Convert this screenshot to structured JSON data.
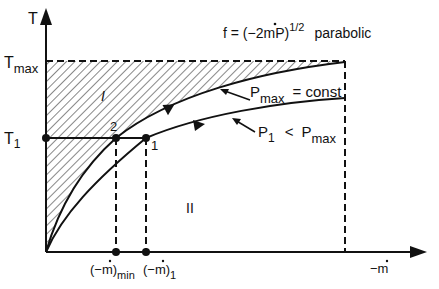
{
  "diagram": {
    "y_axis_label": "T",
    "x_axis_label": "−m",
    "x_axis_dot": "·",
    "t_max_label": "T",
    "t_max_sub": "max",
    "t1_label": "T",
    "t1_sub": "1",
    "formula": {
      "prefix": "f = (−2",
      "m": "m",
      "suffix": "P)",
      "exponent": "1/2",
      "note": "parabolic"
    },
    "region_labels": [
      "I",
      "II"
    ],
    "point_labels": [
      "2",
      "1"
    ],
    "curves": [
      {
        "label": "P",
        "sub": "max",
        "relation": "= const"
      },
      {
        "label": "P",
        "sub": "1",
        "relation": "<",
        "rel_label": "P",
        "rel_sub": "max"
      }
    ],
    "x_ticks": [
      {
        "open": "(−",
        "m": "m",
        "close": ")",
        "sub": "min"
      },
      {
        "open": "(−",
        "m": "m",
        "close": ")",
        "sub": "1"
      }
    ],
    "colors": {
      "ink": "#111111",
      "background": "#ffffff"
    }
  }
}
